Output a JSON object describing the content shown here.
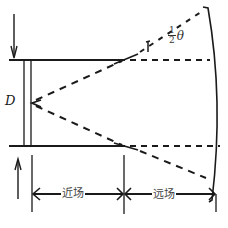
{
  "diagram": {
    "labels": {
      "diameter": "D",
      "near_field": "近场",
      "far_field": "远场",
      "half_angle_num": "1",
      "half_angle_den": "2",
      "half_angle_symbol": "θ"
    },
    "colors": {
      "line": "#1a1a1a",
      "background": "#ffffff"
    }
  }
}
